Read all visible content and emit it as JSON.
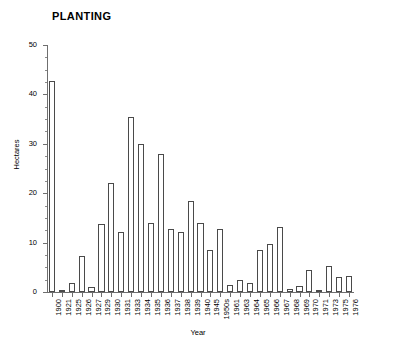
{
  "chart_data": {
    "type": "bar",
    "title": "PLANTING",
    "xlabel": "Year",
    "ylabel": "Hectares",
    "ylim": [
      0,
      50
    ],
    "yticks": [
      0,
      10,
      20,
      30,
      40,
      50
    ],
    "ytick_labels": [
      "0",
      "10",
      "20",
      "30",
      "40",
      "50"
    ],
    "grid": false,
    "legend": "none",
    "bar_face_color": "#ffffff",
    "bar_edge_color": "#4a4a4a",
    "axis_color": "#6f6f6f",
    "categories": [
      "1900",
      "1921",
      "1925",
      "1926",
      "1927",
      "1929",
      "1930",
      "1931",
      "1933",
      "1934",
      "1935",
      "1936",
      "1937",
      "1938",
      "1939",
      "1940",
      "1945",
      "1950s",
      "1961",
      "1963",
      "1964",
      "1965",
      "1966",
      "1967",
      "1968",
      "1969",
      "1970",
      "1971",
      "1973",
      "1975",
      "1976"
    ],
    "values": [
      42.8,
      0.2,
      1.8,
      7.2,
      1.0,
      13.7,
      22.0,
      12.2,
      35.4,
      30.0,
      14.0,
      27.9,
      12.7,
      12.2,
      18.5,
      14.0,
      8.5,
      12.7,
      1.5,
      2.4,
      1.9,
      8.5,
      9.8,
      13.2,
      0.6,
      1.3,
      4.5,
      0.2,
      5.2,
      3.1,
      3.3
    ]
  }
}
